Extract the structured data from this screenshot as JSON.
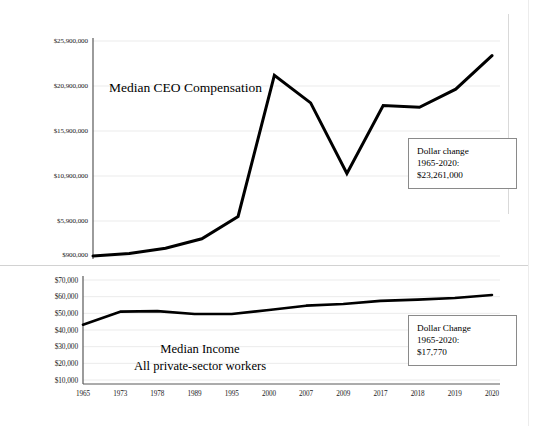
{
  "figure": {
    "background": "#ffffff",
    "line_color": "#000000",
    "grid_color": "#ebebeb",
    "axis_color": "#595959"
  },
  "chart_data": [
    {
      "type": "line",
      "id": "ceo-compensation",
      "title": "Median CEO Compensation",
      "xlabel": "",
      "ylabel": "",
      "grid": true,
      "legend": "none",
      "categories": [
        "1965",
        "1973",
        "1978",
        "1989",
        "1995",
        "2000",
        "2007",
        "2009",
        "2017",
        "2018",
        "2019",
        "2020"
      ],
      "ytick_labels": [
        "$25,900,000",
        "$20,900,000",
        "$15,900,000",
        "$10,900,000",
        "$5,900,000",
        "$900,000"
      ],
      "ytick_values": [
        25900000,
        20900000,
        15900000,
        10900000,
        5900000,
        900000
      ],
      "ylim": [
        900000,
        25900000
      ],
      "values": [
        900000,
        1200000,
        1800000,
        2900000,
        5500000,
        21900000,
        18700000,
        10500000,
        18400000,
        18200000,
        20300000,
        24200000
      ],
      "annotation": {
        "line1": "Dollar change",
        "line2": "1965-2020:",
        "line3": "$23,261,000"
      }
    },
    {
      "type": "line",
      "id": "median-income",
      "title": "Median Income",
      "subtitle": "All private-sector workers",
      "xlabel": "",
      "ylabel": "",
      "grid": true,
      "legend": "none",
      "categories": [
        "1965",
        "1973",
        "1978",
        "1989",
        "1995",
        "2000",
        "2007",
        "2009",
        "2017",
        "2018",
        "2019",
        "2020"
      ],
      "ytick_labels": [
        "$70,000",
        "$60,000",
        "$50,000",
        "$40,000",
        "$30,000",
        "$20,000",
        "$10,000"
      ],
      "ytick_values": [
        70000,
        60000,
        50000,
        40000,
        30000,
        20000,
        10000
      ],
      "ylim": [
        10000,
        70000
      ],
      "values": [
        43200,
        51000,
        51300,
        49600,
        49600,
        52000,
        54600,
        55600,
        57500,
        58200,
        59200,
        61000
      ],
      "annotation": {
        "line1": "Dollar Change",
        "line2": "1965-2020:",
        "line3": "$17,770"
      }
    }
  ]
}
